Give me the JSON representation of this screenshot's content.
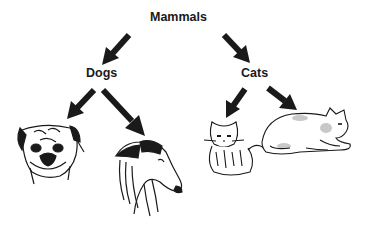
{
  "diagram": {
    "type": "taxonomy-tree",
    "root": {
      "label": "Mammals"
    },
    "branches": [
      {
        "label": "Dogs",
        "children": [
          {
            "name": "pug",
            "illustration": "pug-head-drawing"
          },
          {
            "name": "collie",
            "illustration": "collie-head-drawing"
          }
        ]
      },
      {
        "label": "Cats",
        "children": [
          {
            "name": "fluffy-cat",
            "illustration": "sitting-fluffy-cat-drawing"
          },
          {
            "name": "lying-cat",
            "illustration": "lying-spotted-cat-drawing"
          }
        ]
      }
    ],
    "colors": {
      "ink": "#1a1a1a",
      "background": "#ffffff",
      "shade": "#c8c8c8"
    }
  }
}
